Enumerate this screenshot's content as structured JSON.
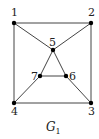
{
  "graph": {
    "caption": {
      "main": "G",
      "sub": "1"
    },
    "nodes": [
      {
        "id": "1",
        "label": "1",
        "x": 14,
        "y": 23
      },
      {
        "id": "2",
        "label": "2",
        "x": 91,
        "y": 23
      },
      {
        "id": "3",
        "label": "3",
        "x": 91,
        "y": 103
      },
      {
        "id": "4",
        "label": "4",
        "x": 14,
        "y": 103
      },
      {
        "id": "5",
        "label": "5",
        "x": 53,
        "y": 50
      },
      {
        "id": "6",
        "label": "6",
        "x": 66,
        "y": 76
      },
      {
        "id": "7",
        "label": "7",
        "x": 40,
        "y": 76
      }
    ],
    "edges": [
      [
        "1",
        "2"
      ],
      [
        "2",
        "3"
      ],
      [
        "3",
        "4"
      ],
      [
        "4",
        "1"
      ],
      [
        "1",
        "5"
      ],
      [
        "2",
        "5"
      ],
      [
        "5",
        "7"
      ],
      [
        "5",
        "6"
      ],
      [
        "7",
        "6"
      ],
      [
        "4",
        "7"
      ],
      [
        "3",
        "6"
      ]
    ]
  }
}
